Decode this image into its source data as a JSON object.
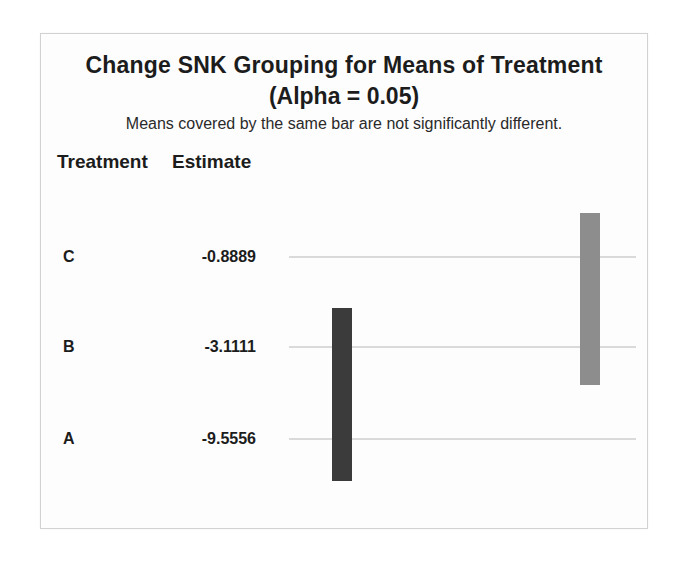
{
  "chart_data": {
    "type": "bar",
    "subtype": "snk-grouping-plot",
    "title": "Change SNK Grouping for Means of Treatment",
    "subtitle": "(Alpha = 0.05)",
    "note": "Means covered by the same bar are not significantly different.",
    "columns": [
      "Treatment",
      "Estimate"
    ],
    "rows": [
      {
        "treatment": "C",
        "estimate": "-0.8889"
      },
      {
        "treatment": "B",
        "estimate": "-3.1111"
      },
      {
        "treatment": "A",
        "estimate": "-9.5556"
      }
    ],
    "grouping_bars": [
      {
        "covers": [
          "B",
          "A"
        ],
        "color": "#3b3b3b",
        "position": "left"
      },
      {
        "covers": [
          "C",
          "B"
        ],
        "color": "#8d8d8d",
        "position": "right"
      }
    ],
    "row_line_color": "#dadada",
    "layout": {
      "orientation": "horizontal-rows",
      "legend": "none",
      "grid": "faint-row-lines",
      "panel_border_color": "#d2d2d2"
    }
  }
}
